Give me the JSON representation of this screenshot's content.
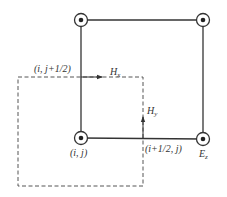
{
  "diagram": {
    "type": "fdtd-yee-grid-te",
    "colors": {
      "line": "#333333",
      "dashed": "#555555",
      "background": "#ffffff"
    },
    "nodes": [
      {
        "id": "top-left",
        "x": 81,
        "y": 20,
        "symbol": "out-of-page-dot"
      },
      {
        "id": "top-right",
        "x": 203,
        "y": 20,
        "symbol": "out-of-page-dot"
      },
      {
        "id": "bottom-left",
        "x": 81,
        "y": 138,
        "symbol": "out-of-page-dot"
      },
      {
        "id": "bottom-right",
        "x": 203,
        "y": 139,
        "symbol": "out-of-page-dot"
      }
    ],
    "labels": {
      "i_j_half": "(i,  j+1/2)",
      "hx_main": "H",
      "hx_sub": "x",
      "hy_main": "H",
      "hy_sub": "y",
      "i_j": "(i,  j)",
      "i_half_j": "(i+1/2,  j)",
      "ez_main": "E",
      "ez_sub": "z"
    }
  }
}
